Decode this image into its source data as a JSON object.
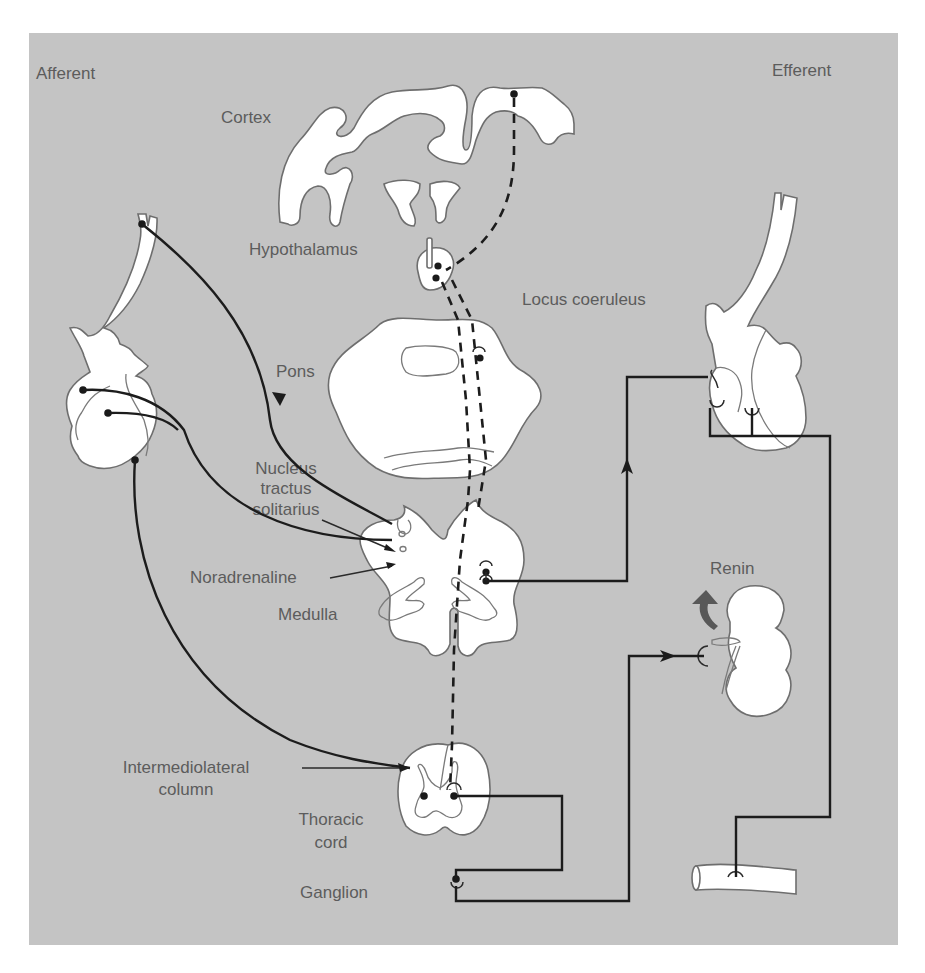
{
  "figure": {
    "background_color": "#c4c4c4",
    "label_color": "#5c5c5c",
    "line_color": "#1c1c1c"
  },
  "headers": {
    "afferent": "Afferent",
    "efferent": "Efferent"
  },
  "labels": {
    "cortex": "Cortex",
    "hypothalamus": "Hypothalamus",
    "locus_coeruleus": "Locus coeruleus",
    "pons": "Pons",
    "nts_line1": "Nucleus",
    "nts_line2": "tractus",
    "nts_line3": "solitarius",
    "noradrenaline": "Noradrenaline",
    "medulla": "Medulla",
    "iml_line1": "Intermediolateral",
    "iml_line2": "column",
    "thoracic_line1": "Thoracic",
    "thoracic_line2": "cord",
    "ganglion": "Ganglion",
    "renin": "Renin"
  },
  "structures": [
    "cortex",
    "hypothalamus",
    "pons",
    "medulla",
    "thoracic-cord",
    "ganglion",
    "afferent-heart",
    "efferent-heart",
    "kidney",
    "blood-vessel"
  ]
}
